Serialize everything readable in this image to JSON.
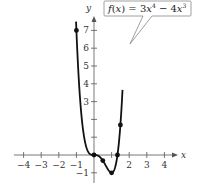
{
  "chart_data": {
    "type": "line",
    "title": "",
    "function_label": "f(x) = 3x⁴ − 4x³",
    "callout": {
      "prefix": "f(x) = 3x",
      "exp1": "4",
      "middle": " − 4x",
      "exp2": "3"
    },
    "xlabel": "x",
    "ylabel": "y",
    "xlim": [
      -4.3,
      4.5
    ],
    "ylim": [
      -1.5,
      7.6
    ],
    "grid": false,
    "x_ticks": [
      -4,
      -3,
      -2,
      -1,
      1,
      2,
      3,
      4
    ],
    "x_tick_labels": [
      "−4",
      "−3",
      "−2",
      "−1",
      "",
      "2",
      "3",
      "4"
    ],
    "y_ticks": [
      -1,
      1,
      2,
      3,
      4,
      5,
      6,
      7
    ],
    "y_tick_labels": [
      "−1",
      "",
      "",
      "3",
      "4",
      "5",
      "6",
      "7"
    ],
    "series": [
      {
        "name": "f(x) = 3x^4 - 4x^3",
        "x_range": [
          -1.0,
          1.6
        ],
        "points": [
          {
            "x": -1,
            "y": 7
          },
          {
            "x": 0,
            "y": 0
          },
          {
            "x": 0.5,
            "y": -0.3125
          },
          {
            "x": 1,
            "y": -1
          },
          {
            "x": 1.3333,
            "y": 0
          },
          {
            "x": 1.5,
            "y": 1.6875
          }
        ]
      }
    ],
    "marked_points": [
      {
        "x": -1,
        "y": 7
      },
      {
        "x": 0,
        "y": 0
      },
      {
        "x": 0.5,
        "y": -0.3125
      },
      {
        "x": 1,
        "y": -1
      },
      {
        "x": 1.3333,
        "y": 0
      },
      {
        "x": 1.5,
        "y": 1.6875
      }
    ],
    "colors": {
      "curve": "#111111",
      "axis": "#555555",
      "callout_border": "#888888"
    }
  }
}
